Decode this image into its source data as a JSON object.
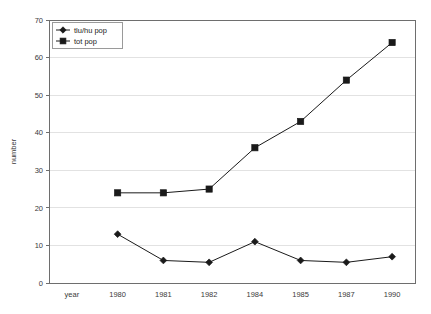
{
  "chart_data": {
    "type": "line",
    "title": "",
    "xlabel": "",
    "ylabel": "number",
    "categories": [
      "year",
      "1980",
      "1981",
      "1982",
      "1984",
      "1985",
      "1987",
      "1990"
    ],
    "ylim": [
      0,
      70
    ],
    "ytick_step": 10,
    "yticks": [
      "0",
      "10",
      "20",
      "30",
      "40",
      "50",
      "60",
      "70"
    ],
    "grid": "horizontal",
    "legend_position": "top-left",
    "series": [
      {
        "name": "tlu/hu pop",
        "marker": "diamond",
        "color": "#1a1a1a",
        "x": [
          "1980",
          "1981",
          "1982",
          "1984",
          "1985",
          "1987",
          "1990"
        ],
        "values": [
          13,
          6,
          5.5,
          11,
          6,
          5.5,
          7
        ]
      },
      {
        "name": "tot pop",
        "marker": "square",
        "color": "#1a1a1a",
        "x": [
          "1980",
          "1981",
          "1982",
          "1984",
          "1985",
          "1987",
          "1990"
        ],
        "values": [
          24,
          24,
          25,
          36,
          43,
          54,
          64
        ]
      }
    ]
  },
  "plot": {
    "left": 49,
    "right": 415,
    "top": 20,
    "bottom": 283
  },
  "legend": {
    "x": 52,
    "y": 22,
    "width": 70,
    "height": 26
  }
}
